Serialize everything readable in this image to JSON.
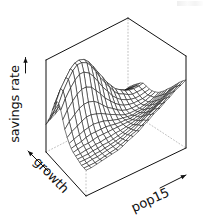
{
  "figure": {
    "kind": "perspective-wireframe-surface",
    "background_color": "#ffffff",
    "line_color": "#111111",
    "hidden_edge_color": "#bdbdbd",
    "width": 205,
    "height": 224
  },
  "axes": {
    "z": {
      "name": "savings-rate-axis",
      "label": "savings rate",
      "arrow": "up"
    },
    "x": {
      "name": "growth-axis",
      "label": "growth",
      "arrow": "up-left"
    },
    "y": {
      "name": "pop15-axis",
      "label": "pop15",
      "arrow": "up-right"
    }
  },
  "chart_data": {
    "type": "line",
    "subtype": "surface3d-wireframe",
    "title": "",
    "xlabel": "growth",
    "ylabel": "pop15",
    "zlabel": "savings rate",
    "grid": false,
    "legend": false,
    "box": true,
    "ticklabels": [],
    "projection": {
      "theta": 40,
      "phi": 22,
      "expand": 0.6
    },
    "x": [
      0.0,
      0.05,
      0.11,
      0.16,
      0.21,
      0.26,
      0.32,
      0.37,
      0.42,
      0.47,
      0.53,
      0.58,
      0.63,
      0.68,
      0.74,
      0.79,
      0.84,
      0.89,
      0.95,
      1.0
    ],
    "y": [
      0.0,
      0.05,
      0.11,
      0.16,
      0.21,
      0.26,
      0.32,
      0.37,
      0.42,
      0.47,
      0.53,
      0.58,
      0.63,
      0.68,
      0.74,
      0.79,
      0.84,
      0.89,
      0.95,
      1.0
    ],
    "z": [
      [
        0.3,
        0.33,
        0.36,
        0.39,
        0.41,
        0.42,
        0.42,
        0.41,
        0.39,
        0.37,
        0.34,
        0.31,
        0.28,
        0.26,
        0.24,
        0.23,
        0.22,
        0.22,
        0.23,
        0.24
      ],
      [
        0.36,
        0.4,
        0.44,
        0.47,
        0.5,
        0.51,
        0.51,
        0.49,
        0.47,
        0.44,
        0.4,
        0.37,
        0.33,
        0.31,
        0.29,
        0.27,
        0.26,
        0.26,
        0.27,
        0.28
      ],
      [
        0.44,
        0.49,
        0.54,
        0.58,
        0.61,
        0.62,
        0.62,
        0.6,
        0.57,
        0.53,
        0.48,
        0.44,
        0.4,
        0.36,
        0.34,
        0.32,
        0.31,
        0.3,
        0.31,
        0.32
      ],
      [
        0.53,
        0.6,
        0.66,
        0.71,
        0.74,
        0.76,
        0.75,
        0.72,
        0.68,
        0.63,
        0.57,
        0.51,
        0.46,
        0.42,
        0.39,
        0.37,
        0.35,
        0.34,
        0.34,
        0.35
      ],
      [
        0.62,
        0.71,
        0.79,
        0.85,
        0.89,
        0.9,
        0.89,
        0.85,
        0.79,
        0.72,
        0.65,
        0.58,
        0.52,
        0.47,
        0.43,
        0.4,
        0.38,
        0.37,
        0.37,
        0.38
      ],
      [
        0.68,
        0.79,
        0.88,
        0.95,
        0.99,
        1.0,
        0.98,
        0.93,
        0.86,
        0.78,
        0.69,
        0.61,
        0.55,
        0.49,
        0.45,
        0.42,
        0.4,
        0.39,
        0.39,
        0.4
      ],
      [
        0.68,
        0.79,
        0.89,
        0.96,
        1.0,
        1.0,
        0.97,
        0.91,
        0.83,
        0.74,
        0.65,
        0.58,
        0.51,
        0.46,
        0.43,
        0.4,
        0.38,
        0.38,
        0.38,
        0.39
      ],
      [
        0.63,
        0.73,
        0.82,
        0.88,
        0.92,
        0.92,
        0.88,
        0.82,
        0.74,
        0.66,
        0.58,
        0.51,
        0.46,
        0.42,
        0.39,
        0.37,
        0.36,
        0.36,
        0.37,
        0.38
      ],
      [
        0.55,
        0.63,
        0.7,
        0.75,
        0.78,
        0.78,
        0.75,
        0.69,
        0.63,
        0.56,
        0.5,
        0.45,
        0.41,
        0.38,
        0.36,
        0.35,
        0.35,
        0.35,
        0.36,
        0.38
      ],
      [
        0.47,
        0.53,
        0.58,
        0.62,
        0.64,
        0.64,
        0.62,
        0.58,
        0.53,
        0.48,
        0.44,
        0.4,
        0.37,
        0.35,
        0.34,
        0.34,
        0.34,
        0.35,
        0.37,
        0.39
      ],
      [
        0.41,
        0.45,
        0.48,
        0.51,
        0.53,
        0.53,
        0.51,
        0.49,
        0.46,
        0.43,
        0.4,
        0.37,
        0.35,
        0.34,
        0.34,
        0.34,
        0.35,
        0.36,
        0.38,
        0.41
      ],
      [
        0.37,
        0.39,
        0.41,
        0.43,
        0.44,
        0.45,
        0.44,
        0.43,
        0.41,
        0.39,
        0.37,
        0.36,
        0.35,
        0.34,
        0.35,
        0.35,
        0.37,
        0.38,
        0.41,
        0.44
      ],
      [
        0.34,
        0.35,
        0.36,
        0.38,
        0.39,
        0.39,
        0.39,
        0.39,
        0.38,
        0.37,
        0.36,
        0.36,
        0.35,
        0.36,
        0.36,
        0.37,
        0.39,
        0.41,
        0.44,
        0.47
      ],
      [
        0.32,
        0.33,
        0.34,
        0.34,
        0.35,
        0.36,
        0.36,
        0.36,
        0.36,
        0.36,
        0.36,
        0.36,
        0.36,
        0.37,
        0.38,
        0.4,
        0.42,
        0.44,
        0.47,
        0.51
      ],
      [
        0.31,
        0.31,
        0.32,
        0.32,
        0.33,
        0.33,
        0.34,
        0.34,
        0.35,
        0.35,
        0.36,
        0.37,
        0.38,
        0.39,
        0.41,
        0.43,
        0.45,
        0.48,
        0.51,
        0.55
      ],
      [
        0.3,
        0.3,
        0.3,
        0.31,
        0.31,
        0.32,
        0.32,
        0.33,
        0.34,
        0.35,
        0.37,
        0.38,
        0.4,
        0.42,
        0.44,
        0.46,
        0.49,
        0.52,
        0.56,
        0.59
      ],
      [
        0.29,
        0.29,
        0.29,
        0.3,
        0.3,
        0.31,
        0.32,
        0.33,
        0.34,
        0.36,
        0.38,
        0.4,
        0.42,
        0.45,
        0.47,
        0.5,
        0.53,
        0.56,
        0.6,
        0.63
      ],
      [
        0.28,
        0.28,
        0.29,
        0.29,
        0.3,
        0.31,
        0.32,
        0.33,
        0.35,
        0.37,
        0.39,
        0.42,
        0.45,
        0.48,
        0.51,
        0.54,
        0.57,
        0.6,
        0.64,
        0.67
      ],
      [
        0.28,
        0.28,
        0.28,
        0.29,
        0.3,
        0.31,
        0.32,
        0.34,
        0.36,
        0.39,
        0.41,
        0.44,
        0.47,
        0.51,
        0.54,
        0.57,
        0.61,
        0.64,
        0.68,
        0.71
      ],
      [
        0.28,
        0.28,
        0.29,
        0.3,
        0.31,
        0.32,
        0.33,
        0.35,
        0.38,
        0.4,
        0.43,
        0.47,
        0.5,
        0.54,
        0.57,
        0.61,
        0.64,
        0.68,
        0.71,
        0.74
      ]
    ]
  }
}
